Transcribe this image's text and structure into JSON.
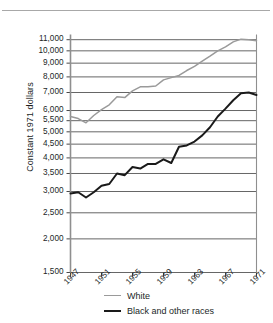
{
  "chart_data": {
    "type": "line",
    "title": "",
    "xlabel": "",
    "ylabel": "Constant 1971 dollars",
    "yscale": "log",
    "ylim": [
      1500,
      11500
    ],
    "xlim": [
      1947,
      1971
    ],
    "grid": true,
    "legend_position": "bottom",
    "ytick_labels": [
      "11,000",
      "10,000",
      "9,000",
      "8,000",
      "7,000",
      "6,000",
      "5,500",
      "5,000",
      "4,500",
      "4,000",
      "3,500",
      "3,000",
      "2,500",
      "2,000",
      "1,500"
    ],
    "yticks": [
      11000,
      10000,
      9000,
      8000,
      7000,
      6000,
      5500,
      5000,
      4500,
      4000,
      3500,
      3000,
      2500,
      2000,
      1500
    ],
    "xtick_labels": [
      "1947",
      "1951",
      "1955",
      "1959",
      "1963",
      "1967",
      "1971"
    ],
    "xticks": [
      1947,
      1951,
      1955,
      1959,
      1963,
      1967,
      1971
    ],
    "x": [
      1947,
      1948,
      1949,
      1950,
      1951,
      1952,
      1953,
      1954,
      1955,
      1956,
      1957,
      1958,
      1959,
      1960,
      1961,
      1962,
      1963,
      1964,
      1965,
      1966,
      1967,
      1968,
      1969,
      1970,
      1971
    ],
    "series": [
      {
        "name": "White",
        "color": "#9a9a9a",
        "values": [
          5700,
          5600,
          5400,
          5750,
          6050,
          6300,
          6750,
          6700,
          7100,
          7350,
          7350,
          7400,
          7800,
          7950,
          8100,
          8450,
          8750,
          9150,
          9550,
          10000,
          10350,
          10800,
          11050,
          11000,
          10900
        ]
      },
      {
        "name": "Black and other races",
        "color": "#1a1a1a",
        "values": [
          2950,
          2980,
          2850,
          2980,
          3150,
          3200,
          3500,
          3450,
          3700,
          3650,
          3800,
          3800,
          3950,
          3830,
          4400,
          4450,
          4600,
          4850,
          5200,
          5700,
          6100,
          6550,
          6950,
          7000,
          6850
        ]
      }
    ]
  },
  "legend": {
    "items": [
      {
        "label": "White"
      },
      {
        "label": "Black and other races"
      }
    ]
  }
}
